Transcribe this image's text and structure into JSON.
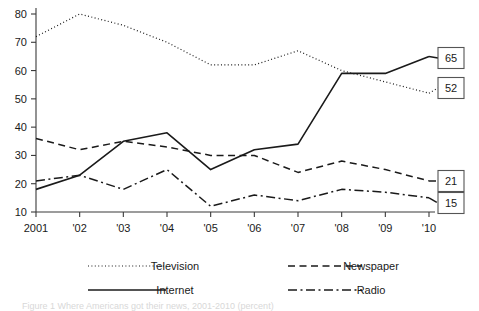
{
  "chart_data": {
    "type": "line",
    "title": "",
    "xlabel": "",
    "ylabel": "",
    "grid": false,
    "legend_position": "bottom",
    "x": [
      "2001",
      "'02",
      "'03",
      "'04",
      "'05",
      "'06",
      "'07",
      "'08",
      "'09",
      "'10"
    ],
    "xlim": [
      "2001",
      "'10"
    ],
    "ylim": [
      10,
      80
    ],
    "yticks": [
      10,
      20,
      30,
      40,
      50,
      60,
      70,
      80
    ],
    "ytick_labels": [
      "10",
      "20",
      "30",
      "40",
      "50",
      "60",
      "70",
      "80"
    ],
    "series": [
      {
        "name": "Television",
        "style": "dotted",
        "values": [
          72,
          80,
          76,
          70,
          62,
          62,
          67,
          60,
          56,
          52
        ],
        "end_label": "52"
      },
      {
        "name": "Newspaper",
        "style": "dashed",
        "values": [
          36,
          32,
          35,
          33,
          30,
          30,
          24,
          28,
          25,
          21
        ],
        "end_label": "21"
      },
      {
        "name": "Internet",
        "style": "solid",
        "values": [
          18,
          23,
          35,
          38,
          25,
          32,
          34,
          59,
          59,
          65
        ],
        "end_label": "65"
      },
      {
        "name": "Radio",
        "style": "dashdot",
        "values": [
          21,
          23,
          18,
          25,
          12,
          16,
          14,
          18,
          17,
          15
        ],
        "end_label": "15"
      }
    ],
    "end_labels": [
      {
        "text": "65",
        "series": "Internet"
      },
      {
        "text": "52",
        "series": "Television"
      },
      {
        "text": "21",
        "series": "Newspaper"
      },
      {
        "text": "15",
        "series": "Radio"
      }
    ],
    "legend": [
      {
        "label": "Television",
        "style": "dotted"
      },
      {
        "label": "Newspaper",
        "style": "dashed"
      },
      {
        "label": "Internet",
        "style": "solid"
      },
      {
        "label": "Radio",
        "style": "dashdot"
      }
    ],
    "colors": {
      "line": "#1a1a1a",
      "axis": "#3a3a3a",
      "box_border": "#555555",
      "background": "#ffffff"
    }
  },
  "caption": {
    "text": "Figure 1  Where Americans got their news, 2001-2010 (percent)"
  }
}
